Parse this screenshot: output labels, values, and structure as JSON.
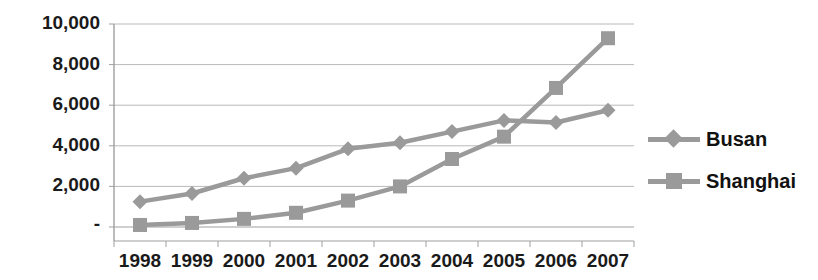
{
  "chart_data": {
    "type": "line",
    "title": "",
    "subtitle": "",
    "xlabel": "",
    "ylabel": "",
    "categories": [
      "1998",
      "1999",
      "2000",
      "2001",
      "2002",
      "2003",
      "2004",
      "2005",
      "2006",
      "2007"
    ],
    "series": [
      {
        "name": "Busan",
        "marker": "diamond",
        "color": "#9a9a9a",
        "values": [
          1250,
          1650,
          2400,
          2900,
          3850,
          4150,
          4700,
          5250,
          5150,
          5750
        ]
      },
      {
        "name": "Shanghai",
        "marker": "square",
        "color": "#9a9a9a",
        "values": [
          100,
          200,
          400,
          700,
          1300,
          2000,
          3350,
          4450,
          6850,
          9300
        ]
      }
    ],
    "ylim": [
      0,
      10000
    ],
    "yticks": [
      0,
      2000,
      4000,
      6000,
      8000,
      10000
    ],
    "ytick_labels": [
      "-",
      "2,000",
      "4,000",
      "6,000",
      "8,000",
      "10,000"
    ],
    "grid": true,
    "grid_axis": "y",
    "legend_position": "right",
    "legend_entries": [
      "Busan",
      "Shanghai"
    ]
  },
  "legend": {
    "items": [
      {
        "label": "Busan"
      },
      {
        "label": "Shanghai"
      }
    ]
  },
  "axes": {
    "y_tick_labels": [
      "10,000",
      "8,000",
      "6,000",
      "4,000",
      "2,000",
      "-"
    ],
    "x_tick_labels": [
      "1998",
      "1999",
      "2000",
      "2001",
      "2002",
      "2003",
      "2004",
      "2005",
      "2006",
      "2007"
    ]
  }
}
